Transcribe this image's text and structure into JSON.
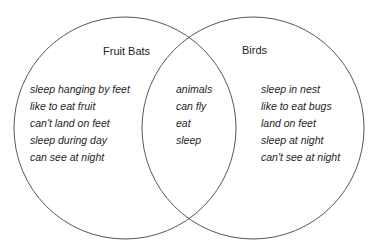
{
  "diagram": {
    "type": "venn",
    "stroke_color": "#555555",
    "background": "#ffffff",
    "sets": [
      {
        "name": "Fruit Bats",
        "unique_items": [
          "sleep hanging by feet",
          "like to eat fruit",
          "can't land on feet",
          "sleep during day",
          "can see at night"
        ]
      },
      {
        "name": "Birds",
        "unique_items": [
          "sleep in nest",
          "like to eat bugs",
          "land on feet",
          "sleep at night",
          "can't see at night"
        ]
      }
    ],
    "intersection": {
      "items": [
        "animals",
        "can fly",
        "eat",
        "sleep"
      ]
    }
  }
}
